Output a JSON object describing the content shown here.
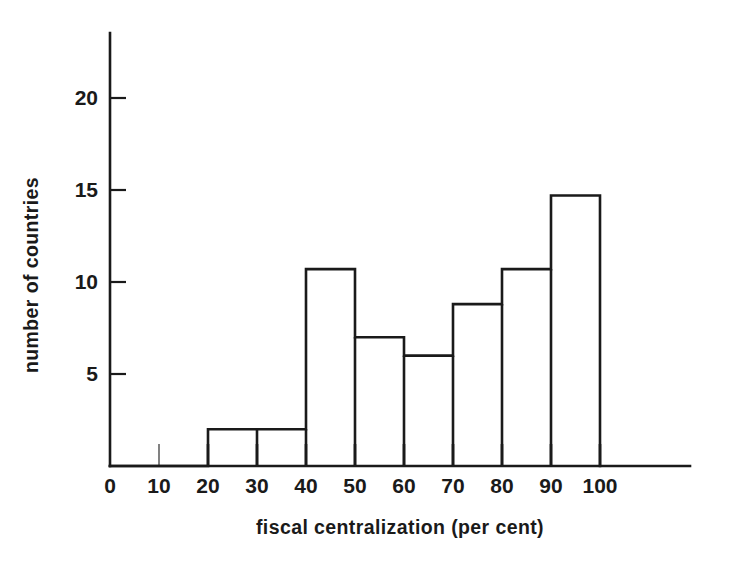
{
  "chart_data": {
    "type": "bar",
    "title": "",
    "subtitle": "",
    "xlabel": "fiscal centralization (per cent)",
    "ylabel": "number of countries",
    "xlim": [
      0,
      117
    ],
    "ylim": [
      0,
      22
    ],
    "grid": false,
    "legend": null,
    "bin_width": 10,
    "x_ticks": [
      0,
      10,
      20,
      30,
      40,
      50,
      60,
      70,
      80,
      90,
      100
    ],
    "x_tick_labels": [
      "0",
      "10",
      "20",
      "30",
      "40",
      "50",
      "60",
      "70",
      "80",
      "90",
      "100"
    ],
    "y_ticks": [
      5,
      10,
      15,
      20
    ],
    "y_tick_labels": [
      "5",
      "10",
      "15",
      "20"
    ],
    "bins": [
      {
        "range": "0-10",
        "x0": 0,
        "x1": 10,
        "value": 0
      },
      {
        "range": "10-20",
        "x0": 10,
        "x1": 20,
        "value": 0
      },
      {
        "range": "20-30",
        "x0": 20,
        "x1": 30,
        "value": 2
      },
      {
        "range": "30-40",
        "x0": 30,
        "x1": 40,
        "value": 2
      },
      {
        "range": "40-50",
        "x0": 40,
        "x1": 50,
        "value": 10.7
      },
      {
        "range": "50-60",
        "x0": 50,
        "x1": 60,
        "value": 7
      },
      {
        "range": "60-70",
        "x0": 60,
        "x1": 70,
        "value": 6
      },
      {
        "range": "70-80",
        "x0": 70,
        "x1": 80,
        "value": 8.8
      },
      {
        "range": "80-90",
        "x0": 80,
        "x1": 90,
        "value": 10.7
      },
      {
        "range": "90-100",
        "x0": 90,
        "x1": 100,
        "value": 14.7
      }
    ],
    "categories": [
      "0-10",
      "10-20",
      "20-30",
      "30-40",
      "40-50",
      "50-60",
      "60-70",
      "70-80",
      "80-90",
      "90-100"
    ],
    "values": [
      0,
      0,
      2,
      2,
      10.7,
      7,
      6,
      8.8,
      10.7,
      14.7
    ],
    "colors": {
      "background": "#ffffff",
      "ink": "#1a1a1a",
      "bar_fill": "#ffffff",
      "bar_stroke": "#1a1a1a"
    }
  },
  "figure": {
    "xlabel": "fiscal centralization (per cent)",
    "ylabel": "number of countries"
  }
}
